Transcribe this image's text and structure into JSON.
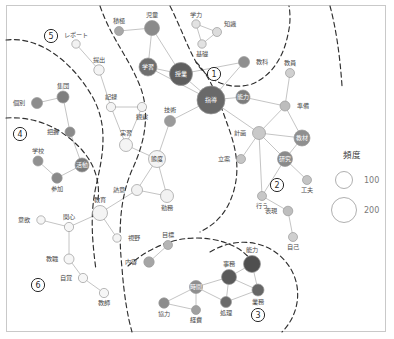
{
  "figure": {
    "type": "network-graph",
    "width": 394,
    "height": 339,
    "background": "#ffffff",
    "border_color": "#c9c9c9"
  },
  "legend": {
    "title": "頻度",
    "entries": [
      {
        "label": "100",
        "radius": 8.5
      },
      {
        "label": "200",
        "radius": 12.5
      }
    ]
  },
  "cluster_numbers": [
    {
      "id": "1",
      "x": 214,
      "y": 74
    },
    {
      "id": "2",
      "x": 277,
      "y": 185
    },
    {
      "id": "3",
      "x": 258,
      "y": 315
    },
    {
      "id": "4",
      "x": 20,
      "y": 134
    },
    {
      "id": "5",
      "x": 51,
      "y": 36
    },
    {
      "id": "6",
      "x": 38,
      "y": 285
    }
  ],
  "colors": {
    "node_light": "#f2f2f2",
    "node_mid": "#b9b9b9",
    "node_dark": "#8d8d8d",
    "node_darkest": "#6e6e6e",
    "node_stroke": "#9a9a9a",
    "edge": "#bdbdbd",
    "boundary": "#2f2f2f",
    "label": "#4b4b4b"
  },
  "nodes": [
    {
      "id": "sekkyoku",
      "label": "積極",
      "x": 119,
      "y": 31,
      "r": 4.5,
      "fill": "#a8a8a8",
      "lp": "top"
    },
    {
      "id": "jidou",
      "label": "児童",
      "x": 152,
      "y": 28,
      "r": 7.5,
      "fill": "#8b8b8b",
      "lp": "top"
    },
    {
      "id": "gakushuu",
      "label": "学習",
      "x": 148,
      "y": 67,
      "r": 9.0,
      "fill": "#6f6f6f",
      "lp": "inner"
    },
    {
      "id": "jugyou",
      "label": "授業",
      "x": 181,
      "y": 74,
      "r": 11.5,
      "fill": "#5f5f5f",
      "lp": "inner"
    },
    {
      "id": "gakuryoku",
      "label": "学力",
      "x": 196,
      "y": 24,
      "r": 4.2,
      "fill": "#e2e2e2",
      "lp": "top"
    },
    {
      "id": "chishiki",
      "label": "知識",
      "x": 217,
      "y": 32,
      "r": 4.5,
      "fill": "#dcdcdc",
      "lp": "topright"
    },
    {
      "id": "kiso",
      "label": "基礎",
      "x": 202,
      "y": 44,
      "r": 4.2,
      "fill": "#e2e2e2",
      "lp": "bottom"
    },
    {
      "id": "kyouka",
      "label": "教科",
      "x": 244,
      "y": 62,
      "r": 5.5,
      "fill": "#8f8f8f",
      "lp": "right"
    },
    {
      "id": "shidou",
      "label": "指導",
      "x": 211,
      "y": 100,
      "r": 14.0,
      "fill": "#696969",
      "lp": "inner"
    },
    {
      "id": "nouryoku2",
      "label": "能力",
      "x": 243,
      "y": 97,
      "r": 7.0,
      "fill": "#7d7d7d",
      "lp": "inner"
    },
    {
      "id": "gijutsu",
      "label": "技術",
      "x": 170,
      "y": 121,
      "r": 5.5,
      "fill": "#9a9a9a",
      "lp": "top"
    },
    {
      "id": "kyouin",
      "label": "教員",
      "x": 290,
      "y": 73,
      "r": 4.5,
      "fill": "#d0d0d0",
      "lp": "top"
    },
    {
      "id": "junbi",
      "label": "準備",
      "x": 285,
      "y": 106,
      "r": 5.0,
      "fill": "#bdbdbd",
      "lp": "right"
    },
    {
      "id": "keikaku",
      "label": "計画",
      "x": 259,
      "y": 133,
      "r": 6.5,
      "fill": "#c9c9c9",
      "lp": "left"
    },
    {
      "id": "kyouzai",
      "label": "教材",
      "x": 302,
      "y": 138,
      "r": 8.0,
      "fill": "#8f8f8f",
      "lp": "inner"
    },
    {
      "id": "kenkyuu",
      "label": "研究",
      "x": 285,
      "y": 159,
      "r": 7.5,
      "fill": "#8a8a8a",
      "lp": "inner"
    },
    {
      "id": "kufuu",
      "label": "工夫",
      "x": 307,
      "y": 180,
      "r": 4.5,
      "fill": "#c4c4c4",
      "lp": "bottom"
    },
    {
      "id": "ritsuan",
      "label": "立案",
      "x": 241,
      "y": 159,
      "r": 4.5,
      "fill": "#c4c4c4",
      "lp": "left"
    },
    {
      "id": "okonau",
      "label": "行う",
      "x": 262,
      "y": 196,
      "r": 4.5,
      "fill": "#c7c7c7",
      "lp": "bottom"
    },
    {
      "id": "hyougen",
      "label": "表現",
      "x": 288,
      "y": 211,
      "r": 4.8,
      "fill": "#bebebe",
      "lp": "left"
    },
    {
      "id": "jiko",
      "label": "自己",
      "x": 293,
      "y": 237,
      "r": 4.5,
      "fill": "#cfcfcf",
      "lp": "bottom"
    },
    {
      "id": "report",
      "label": "レポート",
      "x": 76,
      "y": 44,
      "r": 4.2,
      "fill": "#f2f2f2",
      "lp": "top"
    },
    {
      "id": "teishutsu",
      "label": "提出",
      "x": 99,
      "y": 70,
      "r": 5.2,
      "fill": "#f4f4f4",
      "lp": "top"
    },
    {
      "id": "kiroku",
      "label": "記録",
      "x": 111,
      "y": 107,
      "r": 4.6,
      "fill": "#f4f4f4",
      "lp": "top"
    },
    {
      "id": "kansatsu",
      "label": "観察",
      "x": 142,
      "y": 107,
      "r": 4.6,
      "fill": "#f2f2f2",
      "lp": "bottom"
    },
    {
      "id": "jisshuu",
      "label": "実習",
      "x": 126,
      "y": 145,
      "r": 6.5,
      "fill": "#f4f4f4",
      "lp": "top"
    },
    {
      "id": "taido",
      "label": "態度",
      "x": 157,
      "y": 159,
      "r": 8.5,
      "fill": "#f4f4f4",
      "lp": "inner-dark"
    },
    {
      "id": "netsui",
      "label": "熱意",
      "x": 137,
      "y": 190,
      "r": 5.5,
      "fill": "#f2f2f2",
      "lp": "left"
    },
    {
      "id": "kinmu",
      "label": "勤務",
      "x": 167,
      "y": 196,
      "r": 6.5,
      "fill": "#f2f2f2",
      "lp": "bottom"
    },
    {
      "id": "kyouiku",
      "label": "教育",
      "x": 100,
      "y": 213,
      "r": 7.5,
      "fill": "#f4f4f4",
      "lp": "top"
    },
    {
      "id": "shiya",
      "label": "視野",
      "x": 117,
      "y": 238,
      "r": 4.2,
      "fill": "#f4f4f4",
      "lp": "right"
    },
    {
      "id": "kobetsu",
      "label": "個別",
      "x": 37,
      "y": 103,
      "r": 5.5,
      "fill": "#8d8d8d",
      "lp": "left"
    },
    {
      "id": "shuudan",
      "label": "集団",
      "x": 63,
      "y": 97,
      "r": 6.0,
      "fill": "#7f7f7f",
      "lp": "top"
    },
    {
      "id": "haaku",
      "label": "把握",
      "x": 70,
      "y": 132,
      "r": 5.0,
      "fill": "#8b8b8b",
      "lp": "left"
    },
    {
      "id": "gakkou",
      "label": "学校",
      "x": 38,
      "y": 161,
      "r": 5.0,
      "fill": "#919191",
      "lp": "top"
    },
    {
      "id": "sanka",
      "label": "参加",
      "x": 57,
      "y": 178,
      "r": 5.2,
      "fill": "#8a8a8a",
      "lp": "bottom"
    },
    {
      "id": "katsudou",
      "label": "活動",
      "x": 82,
      "y": 165,
      "r": 7.0,
      "fill": "#7b7b7b",
      "lp": "inner"
    },
    {
      "id": "iyoku",
      "label": "意欲",
      "x": 41,
      "y": 220,
      "r": 4.2,
      "fill": "#f6f6f6",
      "lp": "left"
    },
    {
      "id": "kanshin",
      "label": "関心",
      "x": 69,
      "y": 227,
      "r": 4.6,
      "fill": "#f6f6f6",
      "lp": "top"
    },
    {
      "id": "kyoushoku",
      "label": "教職",
      "x": 69,
      "y": 259,
      "r": 5.0,
      "fill": "#f6f6f6",
      "lp": "left"
    },
    {
      "id": "jikaku",
      "label": "自覚",
      "x": 83,
      "y": 278,
      "r": 4.6,
      "fill": "#f6f6f6",
      "lp": "left"
    },
    {
      "id": "kyoushi",
      "label": "教師",
      "x": 104,
      "y": 293,
      "r": 4.6,
      "fill": "#f6f6f6",
      "lp": "bottom"
    },
    {
      "id": "mokuhyou",
      "label": "目標",
      "x": 168,
      "y": 245,
      "r": 4.5,
      "fill": "#b5b5b5",
      "lp": "top"
    },
    {
      "id": "naiyou",
      "label": "内容",
      "x": 149,
      "y": 262,
      "r": 5.2,
      "fill": "#a5a5a5",
      "lp": "left"
    },
    {
      "id": "jikan",
      "label": "時間",
      "x": 196,
      "y": 287,
      "r": 6.5,
      "fill": "#8e8e8e",
      "lp": "inner"
    },
    {
      "id": "kyouryoku",
      "label": "協力",
      "x": 164,
      "y": 303,
      "r": 5.2,
      "fill": "#8c8c8c",
      "lp": "bottom"
    },
    {
      "id": "keihi",
      "label": "経費",
      "x": 196,
      "y": 310,
      "r": 4.5,
      "fill": "#a0a0a0",
      "lp": "bottom"
    },
    {
      "id": "jimu",
      "label": "事務",
      "x": 229,
      "y": 277,
      "r": 7.5,
      "fill": "#5a5a5a",
      "lp": "top"
    },
    {
      "id": "nouryoku",
      "label": "能力",
      "x": 252,
      "y": 264,
      "r": 8.5,
      "fill": "#4f4f4f",
      "lp": "top"
    },
    {
      "id": "gyoumu",
      "label": "業務",
      "x": 258,
      "y": 290,
      "r": 6.0,
      "fill": "#666666",
      "lp": "bottom"
    },
    {
      "id": "shori",
      "label": "処理",
      "x": 226,
      "y": 302,
      "r": 5.5,
      "fill": "#6b6b6b",
      "lp": "bottom"
    }
  ],
  "edges": [
    [
      "sekkyoku",
      "jidou"
    ],
    [
      "jidou",
      "gakushuu"
    ],
    [
      "jidou",
      "jugyou"
    ],
    [
      "gakushuu",
      "jugyou"
    ],
    [
      "gakushuu",
      "shidou"
    ],
    [
      "jugyou",
      "shidou"
    ],
    [
      "jugyou",
      "kyouka"
    ],
    [
      "gakuryoku",
      "chishiki"
    ],
    [
      "gakuryoku",
      "kiso"
    ],
    [
      "chishiki",
      "kiso"
    ],
    [
      "kyouka",
      "shidou"
    ],
    [
      "shidou",
      "nouryoku2"
    ],
    [
      "shidou",
      "gijutsu"
    ],
    [
      "shidou",
      "keikaku"
    ],
    [
      "nouryoku2",
      "junbi"
    ],
    [
      "kyouin",
      "junbi"
    ],
    [
      "junbi",
      "keikaku"
    ],
    [
      "junbi",
      "kyouzai"
    ],
    [
      "keikaku",
      "kyouzai"
    ],
    [
      "keikaku",
      "kenkyuu"
    ],
    [
      "keikaku",
      "ritsuan"
    ],
    [
      "keikaku",
      "okonau"
    ],
    [
      "kyouzai",
      "kenkyuu"
    ],
    [
      "kenkyuu",
      "kufuu"
    ],
    [
      "kenkyuu",
      "okonau"
    ],
    [
      "okonau",
      "hyougen"
    ],
    [
      "hyougen",
      "jiko"
    ],
    [
      "report",
      "teishutsu"
    ],
    [
      "teishutsu",
      "kiroku"
    ],
    [
      "kiroku",
      "kansatsu"
    ],
    [
      "kiroku",
      "jisshuu"
    ],
    [
      "jisshuu",
      "taido"
    ],
    [
      "taido",
      "netsui"
    ],
    [
      "taido",
      "kinmu"
    ],
    [
      "netsui",
      "kinmu"
    ],
    [
      "netsui",
      "kyouiku"
    ],
    [
      "kyouiku",
      "shiya"
    ],
    [
      "kyouiku",
      "kanshin"
    ],
    [
      "kobetsu",
      "shuudan"
    ],
    [
      "shuudan",
      "haaku"
    ],
    [
      "haaku",
      "katsudou"
    ],
    [
      "gakkou",
      "sanka"
    ],
    [
      "sanka",
      "katsudou"
    ],
    [
      "iyoku",
      "kanshin"
    ],
    [
      "kanshin",
      "kyoushoku"
    ],
    [
      "kyoushoku",
      "jikaku"
    ],
    [
      "jikaku",
      "kyoushi"
    ],
    [
      "mokuhyou",
      "naiyou"
    ],
    [
      "jikan",
      "kyouryoku"
    ],
    [
      "jikan",
      "keihi"
    ],
    [
      "jikan",
      "jimu"
    ],
    [
      "jikan",
      "shori"
    ],
    [
      "jimu",
      "nouryoku"
    ],
    [
      "jimu",
      "gyoumu"
    ],
    [
      "jimu",
      "shori"
    ],
    [
      "nouryoku",
      "gyoumu"
    ],
    [
      "gyoumu",
      "shori"
    ],
    [
      "kyouryoku",
      "keihi"
    ],
    [
      "gijutsu",
      "taido"
    ],
    [
      "jisshuu",
      "kansatsu"
    ]
  ],
  "boundaries": [
    "M 6 40 C 40 36, 72 62, 92 96 C 108 124, 104 152, 96 186 C 90 214, 92 240, 96 270",
    "M 100 6 C 112 40, 128 56, 140 86 C 150 112, 146 140, 132 170 C 120 198, 118 230, 122 268 C 124 296, 128 318, 132 332",
    "M 170 6 C 182 30, 186 44, 196 62 C 210 84, 232 90, 252 84 C 272 76, 284 56, 288 34 C 291 22, 290 12, 289 6",
    "M 6 118 C 36 116, 62 128, 82 150 C 96 166, 100 184, 98 200",
    "M 196 62 C 212 78, 220 104, 228 126 C 236 148, 240 168, 234 190 C 228 212, 216 224, 200 232",
    "M 128 266 C 146 250, 170 238, 196 238 C 222 238, 244 248, 252 262",
    "M 210 252 C 236 236, 268 240, 286 262 C 304 284, 300 314, 282 332",
    "M 330 6 C 336 28, 340 56, 342 86"
  ]
}
